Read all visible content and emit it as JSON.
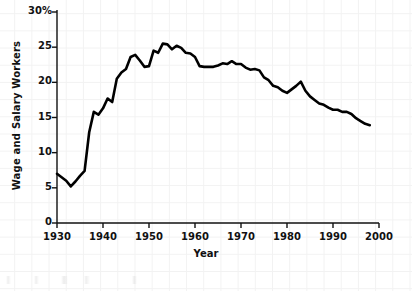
{
  "chart_data": {
    "type": "line",
    "title": "",
    "xlabel": "Year",
    "ylabel": "Wage and Salary Workers",
    "xlim": [
      1930,
      2000
    ],
    "ylim": [
      0,
      30
    ],
    "xticks": [
      1930,
      1940,
      1950,
      1960,
      1970,
      1980,
      1990,
      2000
    ],
    "xtick_labels": [
      "1930",
      "1940",
      "1950",
      "1960",
      "1970",
      "1980",
      "1990",
      "2000"
    ],
    "yticks": [
      0,
      5,
      10,
      15,
      20,
      25,
      30
    ],
    "ytick_labels": [
      "0",
      "5",
      "10",
      "15",
      "20",
      "25",
      "30%"
    ],
    "grid": true,
    "legend": null,
    "line_color": "#000000",
    "line_width": 2.6,
    "x": [
      1930,
      1931,
      1932,
      1933,
      1934,
      1935,
      1936,
      1937,
      1938,
      1939,
      1940,
      1941,
      1942,
      1943,
      1944,
      1945,
      1946,
      1947,
      1948,
      1949,
      1950,
      1951,
      1952,
      1953,
      1954,
      1955,
      1956,
      1957,
      1958,
      1959,
      1960,
      1961,
      1962,
      1963,
      1964,
      1965,
      1966,
      1967,
      1968,
      1969,
      1970,
      1971,
      1972,
      1973,
      1974,
      1975,
      1976,
      1977,
      1978,
      1979,
      1980,
      1981,
      1982,
      1983,
      1984,
      1985,
      1986,
      1987,
      1988,
      1989,
      1990,
      1991,
      1992,
      1993,
      1994,
      1995,
      1996,
      1997,
      1998
    ],
    "values": [
      7.0,
      6.5,
      6.0,
      5.2,
      5.9,
      6.7,
      7.4,
      12.9,
      15.8,
      15.4,
      16.3,
      17.7,
      17.2,
      20.5,
      21.4,
      21.9,
      23.6,
      23.9,
      23.1,
      22.2,
      22.3,
      24.5,
      24.2,
      25.5,
      25.4,
      24.7,
      25.2,
      24.9,
      24.2,
      24.1,
      23.6,
      22.3,
      22.2,
      22.2,
      22.2,
      22.4,
      22.7,
      22.6,
      23.0,
      22.6,
      22.6,
      22.1,
      21.8,
      21.9,
      21.7,
      20.7,
      20.3,
      19.5,
      19.3,
      18.8,
      18.5,
      19.0,
      19.5,
      20.1,
      18.8,
      18.0,
      17.5,
      17.0,
      16.8,
      16.4,
      16.1,
      16.1,
      15.8,
      15.8,
      15.5,
      14.9,
      14.5,
      14.1,
      13.9
    ]
  },
  "axes": {
    "y_axis_name": "percent-of-wage-and-salary-workers",
    "x_axis_name": "year"
  }
}
